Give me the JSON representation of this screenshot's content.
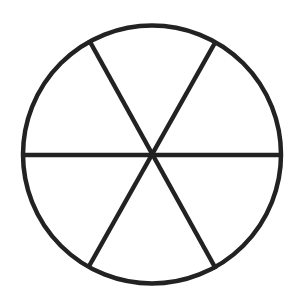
{
  "diagram": {
    "type": "circle-divided-into-six-sectors",
    "background": "#ffffff",
    "stroke_color": "#222222",
    "stroke_width": 4.5,
    "circle": {
      "cx": 152,
      "cy": 154.5,
      "r": 129
    },
    "spokes": [
      {
        "x1": 23,
        "y1": 155,
        "x2": 281,
        "y2": 155
      },
      {
        "x1": 89,
        "y1": 40,
        "x2": 216,
        "y2": 269
      },
      {
        "x1": 216,
        "y1": 41,
        "x2": 88,
        "y2": 268
      }
    ],
    "sector_count": 6
  }
}
